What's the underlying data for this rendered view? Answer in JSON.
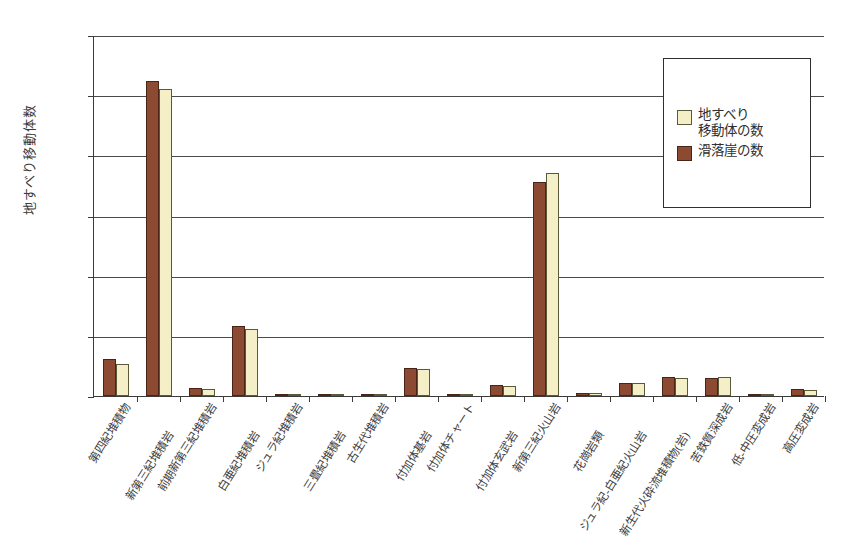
{
  "chart_data": {
    "type": "bar",
    "title": "",
    "xlabel": "",
    "ylabel": "地すべり移動体数",
    "ylim": [
      0,
      6000
    ],
    "ytick_labels": [
      "6,000",
      "5,000",
      "4,000",
      "3,000",
      "2,000",
      "1,000",
      "0"
    ],
    "ytick_values": [
      6000,
      5000,
      4000,
      3000,
      2000,
      1000,
      0
    ],
    "grid": true,
    "legend_position": "upper-right",
    "categories": [
      "第四紀堆積物",
      "新第三紀堆積岩",
      "前期新第三紀堆積岩",
      "白亜紀堆積岩",
      "ジュラ紀堆積岩",
      "三畳紀堆積岩",
      "古生代堆積岩",
      "付加体基岩",
      "付加体チャート",
      "付加体玄武岩",
      "新第三紀火山岩",
      "花崗岩類",
      "ジュラ紀-白亜紀火山岩",
      "新生代火砕流堆積物(岩)",
      "苦鉄質深成岩",
      "低-中圧変成岩",
      "高圧変成岩"
    ],
    "series": [
      {
        "name": "滑落崖の数",
        "color": "#8c4a33",
        "values": [
          620,
          5230,
          140,
          1170,
          25,
          5,
          8,
          470,
          20,
          180,
          3550,
          55,
          220,
          310,
          300,
          5,
          115
        ]
      },
      {
        "name": "地すべり移動体の数",
        "color": "#f4efc6",
        "values": [
          530,
          5100,
          115,
          1120,
          20,
          4,
          6,
          455,
          15,
          165,
          3700,
          45,
          215,
          295,
          320,
          4,
          100
        ]
      }
    ]
  },
  "legend": {
    "items": [
      {
        "swatch": "cream",
        "line1": "地すべり",
        "line2": "移動体の数"
      },
      {
        "swatch": "brown",
        "line1": "滑落崖の数",
        "line2": ""
      }
    ]
  }
}
